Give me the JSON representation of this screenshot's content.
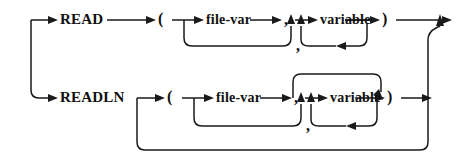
{
  "diagram": {
    "kind": "railroad-syntax-diagram",
    "ink_color": "#1a1a1a",
    "background_color": "#ffffff",
    "width": 462,
    "height": 159,
    "rows": [
      {
        "id": "read-row",
        "keyword": "READ",
        "open_paren": "(",
        "optional_file_var": "file-var",
        "separator_comma": ",",
        "repeated_item": "variable",
        "loop_comma": ",",
        "close_paren": ")"
      },
      {
        "id": "readln-row",
        "keyword": "READLN",
        "open_paren": "(",
        "optional_file_var": "file-var",
        "separator_comma": ",",
        "repeated_item": "variable",
        "loop_comma": ",",
        "close_paren": ")"
      }
    ],
    "labels": {
      "read": "READ",
      "readln": "READLN",
      "file_var": "file-var",
      "variable": "variable",
      "lparen": "(",
      "rparen": ")",
      "comma": ",",
      "comma_top_sep": ",",
      "comma_top_loop": ",",
      "comma_bottom_sep": ",",
      "comma_bottom_loop": ","
    }
  }
}
